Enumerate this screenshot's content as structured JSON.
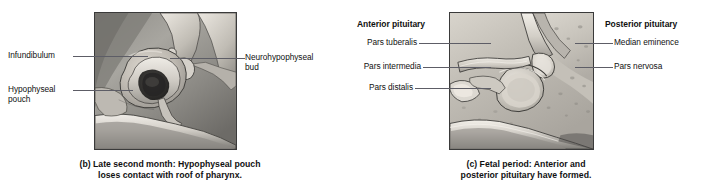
{
  "figure": {
    "panels": [
      {
        "id": "panel-b",
        "letter": "(b)",
        "caption_line1": "(b) Late second month: Hypophyseal pouch",
        "caption_line2": "loses contact with roof of pharynx.",
        "labels_left": [
          {
            "text": "Infundibulum",
            "lines": [
              "Infundibulum"
            ]
          },
          {
            "text": "Hypophyseal pouch",
            "lines": [
              "Hypophyseal",
              "pouch"
            ]
          }
        ],
        "labels_right": [
          {
            "text": "Neurohypophyseal bud",
            "lines": [
              "Neurohypophyseal",
              "bud"
            ]
          }
        ]
      },
      {
        "id": "panel-c",
        "letter": "(c)",
        "caption_line1": "(c) Fetal period: Anterior and",
        "caption_line2": "posterior pituitary have formed.",
        "heading_left": "Anterior pituitary",
        "heading_right": "Posterior pituitary",
        "labels_left": [
          {
            "text": "Pars tuberalis"
          },
          {
            "text": "Pars intermedia"
          },
          {
            "text": "Pars distalis"
          }
        ],
        "labels_right": [
          {
            "text": "Median eminence"
          },
          {
            "text": "Pars nervosa"
          }
        ]
      }
    ],
    "colors": {
      "background": "#ffffff",
      "text": "#111111",
      "leader_line": "#5d5d66",
      "frame_border": "#3a3a3a",
      "tissue_light": "#e0ddd6",
      "tissue_mid": "#a9a6a0",
      "tissue_dark": "#4a4845"
    }
  }
}
